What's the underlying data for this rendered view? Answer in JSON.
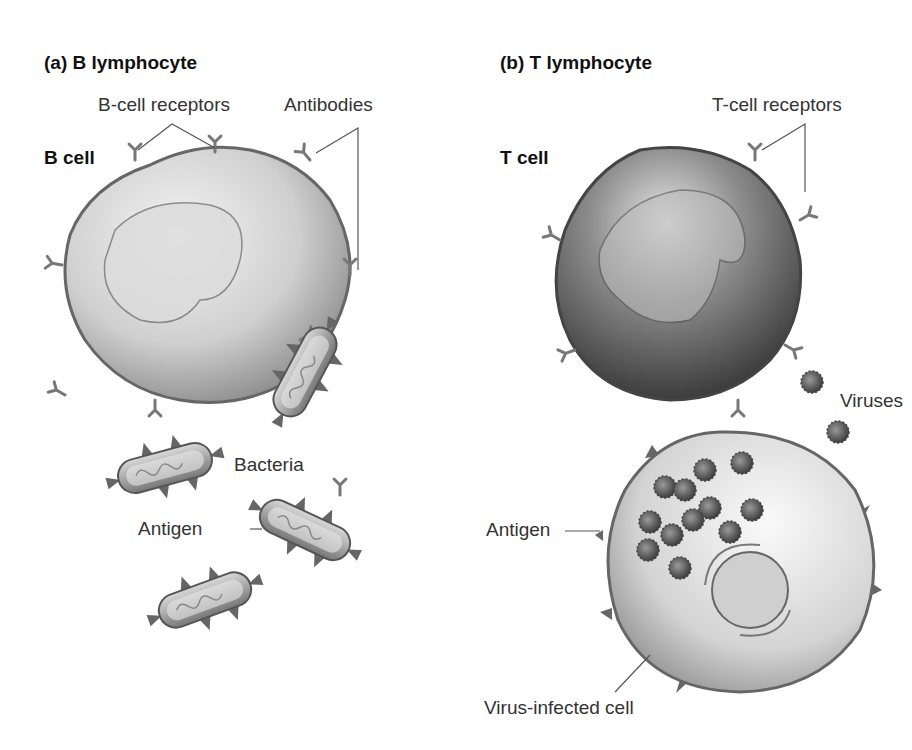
{
  "panel_a": {
    "title": "(a) B lymphocyte",
    "cell_label": "B cell",
    "labels": {
      "receptors": "B-cell receptors",
      "antibodies": "Antibodies",
      "bacteria": "Bacteria",
      "antigen": "Antigen"
    }
  },
  "panel_b": {
    "title": "(b) T lymphocyte",
    "cell_label": "T cell",
    "labels": {
      "receptors": "T-cell receptors",
      "viruses": "Viruses",
      "antigen": "Antigen",
      "infected_cell": "Virus-infected cell"
    }
  },
  "colors": {
    "b_cell_fill": "#c8c8c8",
    "t_cell_fill": "#6e6e6e",
    "infected_cell_fill": "#d6d6d6",
    "virus": "#5a5a5a",
    "bacterium": "#a9a9a9",
    "line": "#555555"
  }
}
